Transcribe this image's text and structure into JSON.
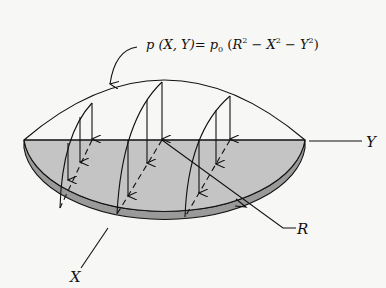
{
  "figure": {
    "type": "pressure distribution on circular disk",
    "formula": {
      "lhs": "p (X, Y)",
      "equals": "=",
      "coef": "p",
      "coef_sub": "0",
      "open": " (",
      "r": "R",
      "r_exp": "2",
      "minus1": " − ",
      "x": "X",
      "x_exp": "2",
      "minus2": " − ",
      "y": "Y",
      "y_exp": "2",
      "close": ")"
    },
    "labels": {
      "x_axis": "X",
      "y_axis": "Y",
      "radius": "R"
    },
    "colors": {
      "background": "#f7f7f5",
      "disk_top": "#c4c4c4",
      "disk_rim": "#9a9a9a",
      "line": "#111111"
    }
  }
}
